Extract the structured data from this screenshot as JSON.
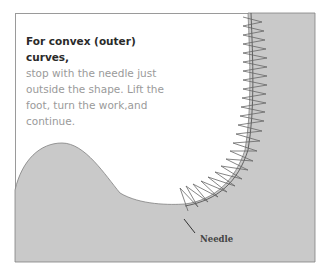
{
  "caption": {
    "heading": "For convex (outer) curves,",
    "body": "stop with the needle just outside the shape. Lift the foot, turn the work,and continue."
  },
  "labels": {
    "needle": "Needle"
  },
  "colors": {
    "fabric": "#c9c9c9",
    "background": "#ffffff",
    "stitch": "#555555",
    "frame": "#9a9a9a"
  }
}
